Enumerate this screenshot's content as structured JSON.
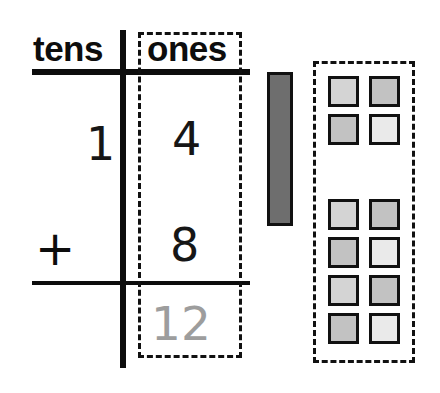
{
  "problem": {
    "type": "place-value-addition",
    "expression": "14 + 8 = 22",
    "operator": "+"
  },
  "chart": {
    "headers": {
      "tens": "tens",
      "ones": "ones"
    },
    "rows": [
      {
        "tens": "1",
        "ones": "4"
      },
      {
        "tens": "+",
        "ones": "8"
      }
    ],
    "answer": {
      "ones": "12",
      "color": "#9d9d9d"
    }
  },
  "manipulatives": {
    "ten_rod": {
      "label": "ten-rod",
      "count": 1,
      "value": 10,
      "color": "#6e6e6e"
    },
    "units_box": {
      "label": "ones-units",
      "total": 12,
      "groups": [
        {
          "name": "first-addend-units",
          "count": 4,
          "shades": [
            "shade-a",
            "shade-b",
            "shade-b",
            "shade-c"
          ]
        },
        {
          "name": "second-addend-units",
          "count": 8,
          "shades": [
            "shade-a",
            "shade-b",
            "shade-b",
            "shade-c",
            "shade-a",
            "shade-b",
            "shade-b",
            "shade-c"
          ]
        }
      ]
    }
  },
  "colors": {
    "ink": "#0d0d0d",
    "rod_fill": "#6e6e6e",
    "cube_fill": "#cfcfcf",
    "hint_text": "#9d9d9d"
  }
}
